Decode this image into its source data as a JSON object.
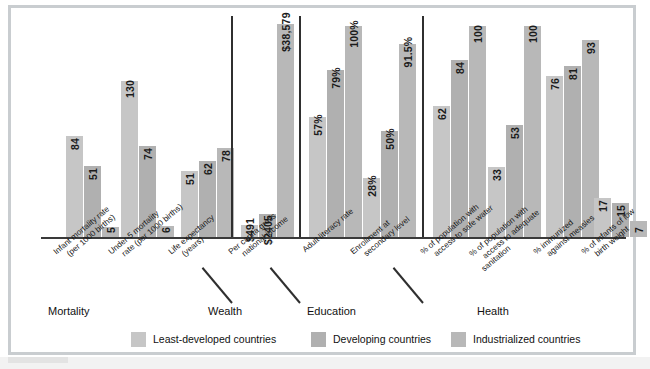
{
  "chart_data": {
    "type": "bar",
    "title": "",
    "xlabel": "",
    "ylabel": "",
    "grid": false,
    "legend_position": "bottom",
    "series": [
      {
        "name": "Least-developed countries",
        "color": "#c6c6c6"
      },
      {
        "name": "Developing countries",
        "color": "#b0b0b0"
      },
      {
        "name": "Industrialized countries",
        "color": "#b8b8b8"
      }
    ],
    "groups": [
      {
        "group": "Mortality",
        "categories": [
          {
            "label_line1": "Infant mortality rate",
            "label_line2": "(per 1000 births)",
            "values": [
              84,
              51,
              5
            ],
            "display": [
              "84",
              "51",
              "5"
            ]
          },
          {
            "label_line1": "Under-5 mortality",
            "label_line2": "rate (per 1000 births)",
            "values": [
              130,
              74,
              6
            ],
            "display": [
              "130",
              "74",
              "6"
            ]
          },
          {
            "label_line1": "Life expectancy",
            "label_line2": "(years)",
            "values": [
              51,
              62,
              78
            ],
            "display": [
              "51",
              "62",
              "78"
            ]
          }
        ]
      },
      {
        "group": "Wealth",
        "categories": [
          {
            "label_line1": "Per capita gross",
            "label_line2": "national income",
            "values": [
              491,
              2405,
              38579
            ],
            "display": [
              "$491",
              "$2405",
              "$38,579"
            ]
          }
        ]
      },
      {
        "group": "Education",
        "categories": [
          {
            "label_line1": "Adult literacy rate",
            "label_line2": "",
            "values": [
              57,
              79,
              100
            ],
            "display": [
              "57%",
              "79%",
              "100%"
            ]
          },
          {
            "label_line1": "Enrollment at",
            "label_line2": "secondary level",
            "values": [
              28,
              50,
              91.5
            ],
            "display": [
              "28%",
              "50%",
              "91.5%"
            ]
          }
        ]
      },
      {
        "group": "Health",
        "categories": [
          {
            "label_line1": "% of population with",
            "label_line2": "access to safe water",
            "values": [
              62,
              84,
              100
            ],
            "display": [
              "62",
              "84",
              "100"
            ]
          },
          {
            "label_line1": "% of population with",
            "label_line2": "access to adequate",
            "label_line3": "sanitation",
            "values": [
              33,
              53,
              100
            ],
            "display": [
              "33",
              "53",
              "100"
            ]
          },
          {
            "label_line1": "% immunized",
            "label_line2": "against measles",
            "values": [
              76,
              81,
              93
            ],
            "display": [
              "76",
              "81",
              "93"
            ]
          },
          {
            "label_line1": "% of infants of low",
            "label_line2": "birth weight",
            "values": [
              17,
              15,
              7
            ],
            "display": [
              "17",
              "15",
              "7"
            ]
          }
        ]
      }
    ]
  },
  "legend": {
    "items": [
      "Least-developed countries",
      "Developing countries",
      "Industrialized countries"
    ]
  },
  "group_names": [
    "Mortality",
    "Wealth",
    "Education",
    "Health"
  ],
  "categories_flat": [
    {
      "l1": "Infant mortality rate",
      "l2": "(per 1000 births)",
      "l3": ""
    },
    {
      "l1": "Under-5 mortality",
      "l2": "rate (per 1000 births)",
      "l3": ""
    },
    {
      "l1": "Life expectancy",
      "l2": "(years)",
      "l3": ""
    },
    {
      "l1": "Per capita gross",
      "l2": "national income",
      "l3": ""
    },
    {
      "l1": "Adult literacy rate",
      "l2": "",
      "l3": ""
    },
    {
      "l1": "Enrollment at",
      "l2": "secondary level",
      "l3": ""
    },
    {
      "l1": "% of population with",
      "l2": "access to safe water",
      "l3": ""
    },
    {
      "l1": "% of population with",
      "l2": "access to adequate",
      "l3": "sanitation"
    },
    {
      "l1": "% immunized",
      "l2": "against measles",
      "l3": ""
    },
    {
      "l1": "% of infants of low",
      "l2": "birth weight",
      "l3": ""
    }
  ]
}
